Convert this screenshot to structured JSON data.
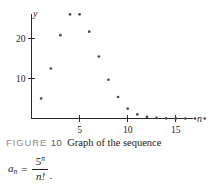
{
  "figure": {
    "label": "FIGURE",
    "number": "10",
    "caption": "Graph of the sequence",
    "formula": {
      "lhs_base": "a",
      "lhs_sub": "n",
      "equals": "=",
      "numerator_base": "5",
      "numerator_sup": "n",
      "denominator": "n!",
      "trailing_period": "."
    }
  },
  "chart_data": {
    "type": "scatter",
    "xlabel": "n",
    "ylabel": "y",
    "xlim": [
      0,
      19
    ],
    "ylim": [
      0,
      28
    ],
    "grid": false,
    "legend": "none",
    "x_ticks": [
      5,
      10,
      15
    ],
    "x_tick_labels": [
      "5",
      "10",
      "15"
    ],
    "y_ticks": [
      10,
      20
    ],
    "y_tick_labels": [
      "10",
      "20"
    ],
    "x": [
      1,
      2,
      3,
      4,
      5,
      6,
      7,
      8,
      9,
      10,
      11,
      12,
      13,
      14,
      15,
      16,
      17,
      18
    ],
    "values": [
      5,
      12.5,
      20.83,
      26.04,
      26.04,
      21.7,
      15.5,
      9.69,
      5.38,
      2.45,
      1.02,
      0.39,
      0.14,
      0.05,
      0.02,
      0.005,
      0.001,
      0.0004
    ],
    "series": [
      {
        "name": "a_n = 5^n / n!",
        "values": [
          5,
          12.5,
          20.83,
          26.04,
          26.04,
          21.7,
          15.5,
          9.69,
          5.38,
          2.45,
          1.02,
          0.39,
          0.14,
          0.05,
          0.02,
          0.005,
          0.001,
          0.0004
        ]
      }
    ],
    "point_color": "#4a4a4a",
    "axis_color": "#2b2b2b"
  }
}
